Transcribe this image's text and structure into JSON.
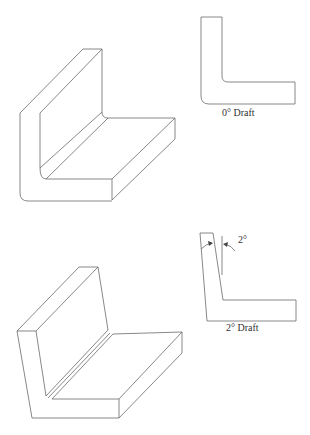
{
  "figure": {
    "panels": [
      {
        "id": "zero-draft",
        "label": "0° Draft",
        "description": "Isometric L-bracket with 0° draft and its cross-section profile"
      },
      {
        "id": "two-draft",
        "label": "2° Draft",
        "angle_annotation": "2°",
        "description": "Isometric L-bracket with 2° draft and its cross-section profile"
      }
    ]
  },
  "colors": {
    "line": "#6a6a6a",
    "background": "#ffffff",
    "text": "#333333"
  }
}
